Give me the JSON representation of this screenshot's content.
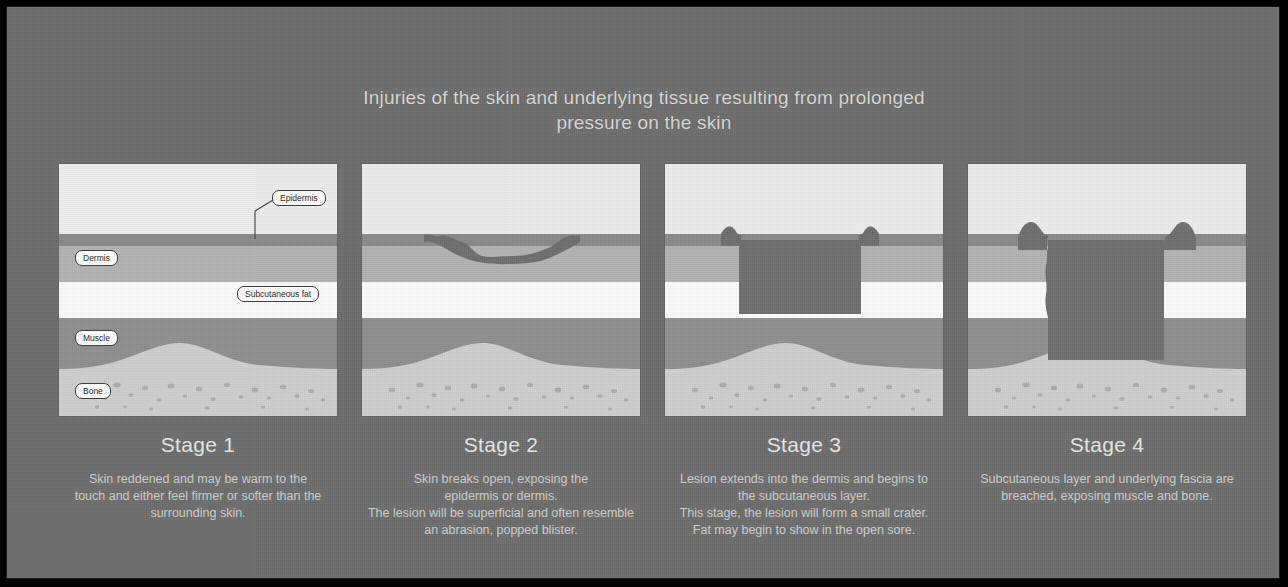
{
  "poster": {
    "background_color": "#6e6e6e",
    "border_color": "#1a1a1a",
    "title_lines": [
      "Injuries of the skin and underlying tissue resulting from prolonged",
      "pressure on the skin"
    ]
  },
  "anatomy_labels": {
    "epidermis": "Epidermis",
    "dermis": "Dermis",
    "subcutaneous_fat": "Subcutaneous fat",
    "muscle": "Muscle",
    "bone": "Bone"
  },
  "layer_colors": {
    "epidermis": "#8a8a8a",
    "dermis": "#b3b3b3",
    "subcutaneous_fat": "#fbfbfb",
    "muscle": "#8f8f8f",
    "bone": "#cfcfcf",
    "bone_speckle": "#a9a9a9",
    "skin_surface": "#ededed",
    "wound": "#6f6f6f",
    "label_fill": "#fdfdfd",
    "label_stroke": "#3c3c3c"
  },
  "stages": [
    {
      "title": "Stage 1",
      "description_lines": [
        "Skin reddened and may be warm to the",
        "touch and either feel firmer or softer than the",
        "surrounding skin."
      ],
      "wound": "none",
      "has_labels": true
    },
    {
      "title": "Stage 2",
      "description_lines": [
        "Skin breaks open, exposing the",
        "epidermis or dermis.",
        "The lesion will be superficial and often resemble",
        "an abrasion, popped blister."
      ],
      "wound": "shallow",
      "has_labels": false
    },
    {
      "title": "Stage 3",
      "description_lines": [
        "Lesion extends into the dermis and begins to",
        "the subcutaneous layer.",
        "This stage, the lesion will form a small crater.",
        "Fat may begin to show in the open sore."
      ],
      "wound": "crater",
      "has_labels": false
    },
    {
      "title": "Stage 4",
      "description_lines": [
        "Subcutaneous layer and underlying fascia are",
        "breached, exposing muscle and bone."
      ],
      "wound": "deep",
      "has_labels": false
    }
  ]
}
